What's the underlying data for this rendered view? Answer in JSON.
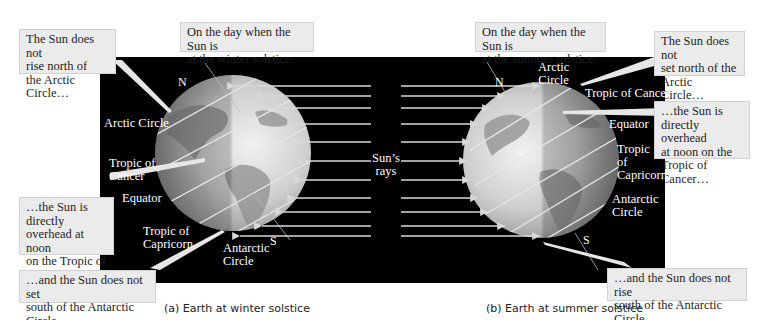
{
  "figure": {
    "panel_a": {
      "caption": "(a)  Earth at winter solstice",
      "header": "On the day when the Sun is\nat the winter solstice:",
      "callouts": {
        "arctic": "The Sun does not\nrise north of\nthe Arctic Circle…",
        "tropic": "…the Sun is directly\noverhead at noon\non the Tropic of\nCapricorn…",
        "antarctic": "…and the Sun does not set\nsouth of the Antarctic Circle."
      },
      "labels": {
        "north": "N",
        "south": "S",
        "arctic_circle": "Arctic Circle",
        "tropic_of_cancer": "Tropic of\nCancer",
        "equator": "Equator",
        "tropic_of_capricorn": "Tropic of\nCapricorn",
        "antarctic_circle": "Antarctic\nCircle"
      }
    },
    "center_label": "Sun’s\nrays",
    "panel_b": {
      "caption": "(b)  Earth at summer solstice",
      "header": "On the day when the Sun is\nat the summer solstice:",
      "callouts": {
        "arctic": "The Sun does not\nset north of the\nArctic Circle…",
        "tropic": "…the Sun is\ndirectly overhead\nat noon on the\nTropic of Cancer…",
        "antarctic": "…and the Sun does not rise\nsouth of the Antarctic Circle."
      },
      "labels": {
        "north": "N",
        "south": "S",
        "arctic_circle": "Arctic\nCircle",
        "tropic_of_cancer": "Tropic of Cancer",
        "equator": "Equator",
        "tropic_of_capricorn": "Tropic\nof\nCapricorn",
        "antarctic_circle": "Antarctic\nCircle"
      }
    },
    "colors": {
      "background": "#ffffff",
      "panel": "#000000",
      "callout_fill": "#ebebeb",
      "label_text": "#ffffff",
      "ray": "#d8d8d8"
    }
  }
}
